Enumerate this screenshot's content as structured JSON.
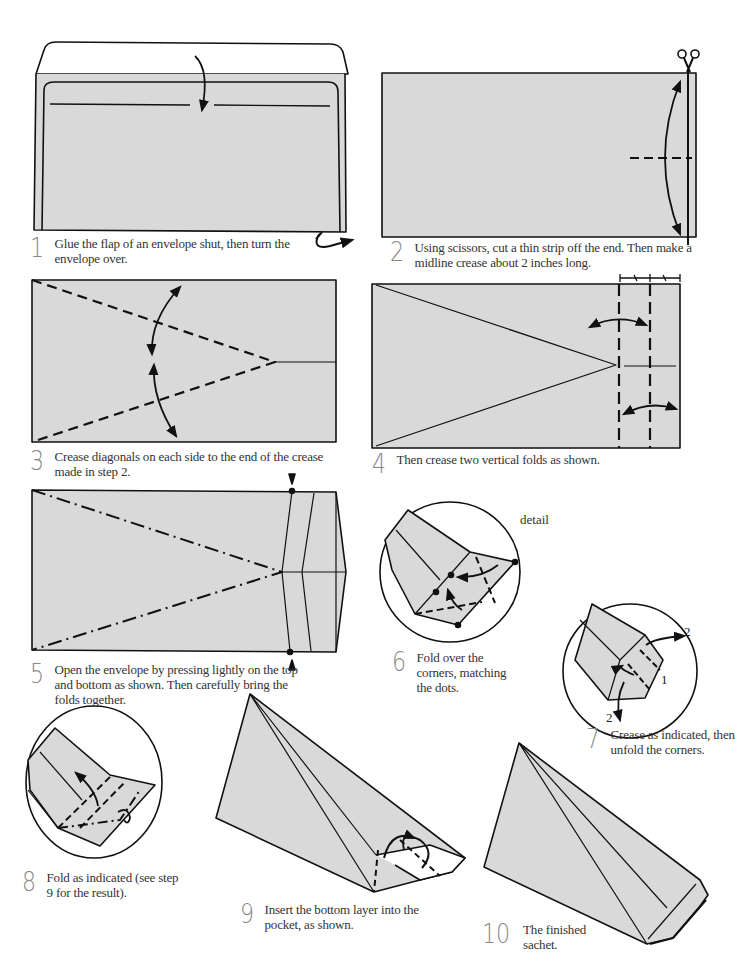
{
  "page": {
    "fill_color": "#d9d9d9",
    "line_color": "#111111",
    "background": "#ffffff"
  },
  "steps": [
    {
      "number": "1",
      "text": "Glue the flap of an envelope shut, then turn the envelope over."
    },
    {
      "number": "2",
      "text": "Using scissors, cut a thin strip off the end. Then make a midline crease about 2 inches long."
    },
    {
      "number": "3",
      "text": "Crease diagonals on each side to the end of the crease made in step 2."
    },
    {
      "number": "4",
      "text": "Then crease two vertical folds as shown."
    },
    {
      "number": "5",
      "text": "Open the envelope by pressing lightly on the top and bottom as shown. Then carefully bring the folds together."
    },
    {
      "number": "6",
      "text": "Fold over the corners, matching the dots."
    },
    {
      "number": "7",
      "text": "Crease as indicated, then unfold the corners."
    },
    {
      "number": "8",
      "text": "Fold as indicated (see step 9 for the result)."
    },
    {
      "number": "9",
      "text": "Insert the bottom layer into the pocket, as shown."
    },
    {
      "number": "10",
      "text": "The finished sachet."
    }
  ],
  "annotations": {
    "detail_label": "detail",
    "step7_labels": [
      "2",
      "1",
      "2"
    ],
    "icons": [
      "scissors-icon",
      "turn-over-arrow-icon",
      "fold-arrow-icon",
      "equal-length-marks-icon",
      "press-arrow-icon"
    ]
  }
}
